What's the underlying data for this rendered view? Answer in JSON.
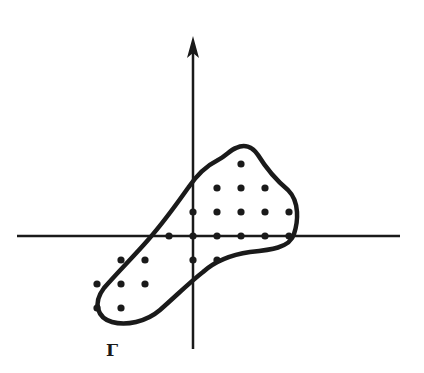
{
  "diagram": {
    "region_label": "Γ",
    "colors": {
      "ink": "#1a1a1a",
      "background": "#ffffff"
    },
    "axes": {
      "origin_px": [
        193,
        236
      ],
      "grid_spacing_px": 24,
      "x_axis_range_px": [
        17,
        400
      ],
      "y_axis_range_px": [
        38,
        349
      ],
      "y_arrow": true
    },
    "lattice_points": [
      [
        2,
        3
      ],
      [
        1,
        2
      ],
      [
        2,
        2
      ],
      [
        3,
        2
      ],
      [
        0,
        1
      ],
      [
        1,
        1
      ],
      [
        2,
        1
      ],
      [
        3,
        1
      ],
      [
        4,
        1
      ],
      [
        -1,
        0
      ],
      [
        0,
        0
      ],
      [
        1,
        0
      ],
      [
        2,
        0
      ],
      [
        3,
        0
      ],
      [
        4,
        0
      ],
      [
        -3,
        -1
      ],
      [
        -2,
        -1
      ],
      [
        0,
        -1
      ],
      [
        1,
        -1
      ],
      [
        -4,
        -2
      ],
      [
        -3,
        -2
      ],
      [
        -2,
        -2
      ],
      [
        -4,
        -3
      ],
      [
        -3,
        -3
      ]
    ]
  }
}
